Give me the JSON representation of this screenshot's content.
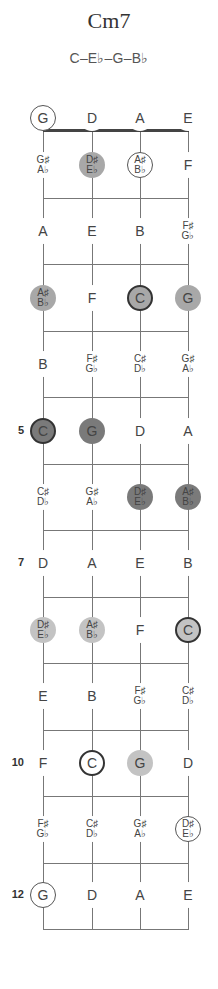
{
  "title": "Cm7",
  "formula": "C–E♭–G–B♭",
  "strings": [
    "G",
    "D",
    "A",
    "E"
  ],
  "fret_markers": [
    {
      "fret": 5,
      "label": "5"
    },
    {
      "fret": 7,
      "label": "7"
    },
    {
      "fret": 10,
      "label": "10"
    },
    {
      "fret": 12,
      "label": "12"
    }
  ],
  "fretboard": [
    {
      "fret": 0,
      "notes": [
        {
          "top": "G",
          "bottom": "",
          "style": "ring"
        },
        {
          "top": "D",
          "bottom": "",
          "style": "none"
        },
        {
          "top": "A",
          "bottom": "",
          "style": "none"
        },
        {
          "top": "E",
          "bottom": "",
          "style": "none"
        }
      ]
    },
    {
      "fret": 1,
      "notes": [
        {
          "top": "G♯",
          "bottom": "A♭",
          "style": "none"
        },
        {
          "top": "D♯",
          "bottom": "E♭",
          "style": "fill-mid"
        },
        {
          "top": "A♯",
          "bottom": "B♭",
          "style": "ring"
        },
        {
          "top": "F",
          "bottom": "",
          "style": "none"
        }
      ]
    },
    {
      "fret": 2,
      "notes": [
        {
          "top": "A",
          "bottom": "",
          "style": "none"
        },
        {
          "top": "E",
          "bottom": "",
          "style": "none"
        },
        {
          "top": "B",
          "bottom": "",
          "style": "none"
        },
        {
          "top": "F♯",
          "bottom": "G♭",
          "style": "none"
        }
      ]
    },
    {
      "fret": 3,
      "notes": [
        {
          "top": "A♯",
          "bottom": "B♭",
          "style": "fill-mid"
        },
        {
          "top": "F",
          "bottom": "",
          "style": "none"
        },
        {
          "top": "C",
          "bottom": "",
          "style": "fill-mid-ring"
        },
        {
          "top": "G",
          "bottom": "",
          "style": "fill-mid"
        }
      ]
    },
    {
      "fret": 4,
      "notes": [
        {
          "top": "B",
          "bottom": "",
          "style": "none"
        },
        {
          "top": "F♯",
          "bottom": "G♭",
          "style": "none"
        },
        {
          "top": "C♯",
          "bottom": "D♭",
          "style": "none"
        },
        {
          "top": "G♯",
          "bottom": "A♭",
          "style": "none"
        }
      ]
    },
    {
      "fret": 5,
      "notes": [
        {
          "top": "C",
          "bottom": "",
          "style": "fill-dark-ring"
        },
        {
          "top": "G",
          "bottom": "",
          "style": "fill-dark"
        },
        {
          "top": "D",
          "bottom": "",
          "style": "none"
        },
        {
          "top": "A",
          "bottom": "",
          "style": "none"
        }
      ]
    },
    {
      "fret": 6,
      "notes": [
        {
          "top": "C♯",
          "bottom": "D♭",
          "style": "none"
        },
        {
          "top": "G♯",
          "bottom": "A♭",
          "style": "none"
        },
        {
          "top": "D♯",
          "bottom": "E♭",
          "style": "fill-dark"
        },
        {
          "top": "A♯",
          "bottom": "B♭",
          "style": "fill-dark"
        }
      ]
    },
    {
      "fret": 7,
      "notes": [
        {
          "top": "D",
          "bottom": "",
          "style": "none"
        },
        {
          "top": "A",
          "bottom": "",
          "style": "none"
        },
        {
          "top": "E",
          "bottom": "",
          "style": "none"
        },
        {
          "top": "B",
          "bottom": "",
          "style": "none"
        }
      ]
    },
    {
      "fret": 8,
      "notes": [
        {
          "top": "D♯",
          "bottom": "E♭",
          "style": "fill-light"
        },
        {
          "top": "A♯",
          "bottom": "B♭",
          "style": "fill-light"
        },
        {
          "top": "F",
          "bottom": "",
          "style": "none"
        },
        {
          "top": "C",
          "bottom": "",
          "style": "fill-light-ring"
        }
      ]
    },
    {
      "fret": 9,
      "notes": [
        {
          "top": "E",
          "bottom": "",
          "style": "none"
        },
        {
          "top": "B",
          "bottom": "",
          "style": "none"
        },
        {
          "top": "F♯",
          "bottom": "G♭",
          "style": "none"
        },
        {
          "top": "C♯",
          "bottom": "D♭",
          "style": "none"
        }
      ]
    },
    {
      "fret": 10,
      "notes": [
        {
          "top": "F",
          "bottom": "",
          "style": "none"
        },
        {
          "top": "C",
          "bottom": "",
          "style": "ring-thick"
        },
        {
          "top": "G",
          "bottom": "",
          "style": "fill-light"
        },
        {
          "top": "D",
          "bottom": "",
          "style": "none"
        }
      ]
    },
    {
      "fret": 11,
      "notes": [
        {
          "top": "F♯",
          "bottom": "G♭",
          "style": "none"
        },
        {
          "top": "C♯",
          "bottom": "D♭",
          "style": "none"
        },
        {
          "top": "G♯",
          "bottom": "A♭",
          "style": "none"
        },
        {
          "top": "D♯",
          "bottom": "E♭",
          "style": "ring"
        }
      ]
    },
    {
      "fret": 12,
      "notes": [
        {
          "top": "G",
          "bottom": "",
          "style": "ring"
        },
        {
          "top": "D",
          "bottom": "",
          "style": "none"
        },
        {
          "top": "A",
          "bottom": "",
          "style": "none"
        },
        {
          "top": "E",
          "bottom": "",
          "style": "none"
        }
      ]
    }
  ],
  "colors": {
    "dark": "#7a7a7a",
    "mid": "#a8a8a8",
    "light": "#c3c3c3",
    "line": "#777777"
  }
}
